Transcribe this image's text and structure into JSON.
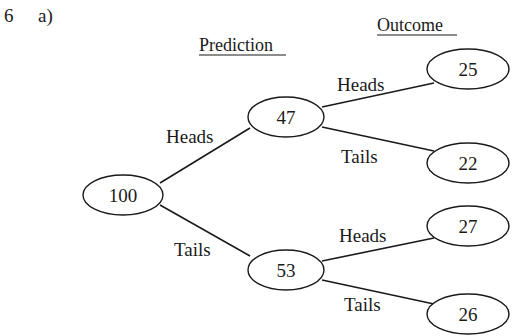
{
  "question": {
    "number": "6",
    "part": "a)"
  },
  "headers": {
    "prediction": "Prediction",
    "outcome": "Outcome"
  },
  "tree": {
    "root": {
      "value": "100"
    },
    "prediction_nodes": [
      {
        "branch_label": "Heads",
        "value": "47",
        "outcomes": [
          {
            "branch_label": "Heads",
            "value": "25"
          },
          {
            "branch_label": "Tails",
            "value": "22"
          }
        ]
      },
      {
        "branch_label": "Tails",
        "value": "53",
        "outcomes": [
          {
            "branch_label": "Heads",
            "value": "27"
          },
          {
            "branch_label": "Tails",
            "value": "26"
          }
        ]
      }
    ]
  }
}
